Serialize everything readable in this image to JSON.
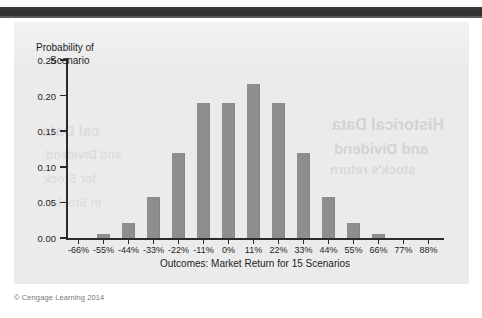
{
  "page": {
    "top_strip_text": "Part 2   Valuation",
    "credit": "© Cengage Learning 2014",
    "ghost_text": {
      "g1": "Historical Data",
      "g2": "and Dividend",
      "g3": "stock's return",
      "g4": "cal Data",
      "g5": "and Dividend",
      "g6": "for Stock",
      "g7": "in Stocks"
    }
  },
  "colors": {
    "bar": "#8e8e8e",
    "axis": "#2b2b2b",
    "panel_background": "#ebebeb",
    "header_bar": "#303032",
    "text": "#1d1d1d",
    "credit_text": "#77777a"
  },
  "chart_data": {
    "type": "bar",
    "title": "",
    "xlabel": "Outcomes: Market Return for 15 Scenarios",
    "ylabel": "Probability of Scenario",
    "ylabel_line1": "Probability of",
    "ylabel_line2": "Scenario",
    "categories": [
      "-66%",
      "-55%",
      "-44%",
      "-33%",
      "-22%",
      "-11%",
      "0%",
      "11%",
      "22%",
      "33%",
      "44%",
      "55%",
      "66%",
      "77%",
      "88%"
    ],
    "values": [
      0.0,
      0.005,
      0.021,
      0.058,
      0.12,
      0.189,
      0.189,
      0.216,
      0.189,
      0.12,
      0.058,
      0.021,
      0.005,
      0.0,
      0.0
    ],
    "ylim": [
      0.0,
      0.25
    ],
    "yticks": [
      "0.00",
      "0.05",
      "0.10",
      "0.15",
      "0.20",
      "0.25"
    ],
    "ytick_values": [
      0.0,
      0.05,
      0.1,
      0.15,
      0.2,
      0.25
    ],
    "grid": false,
    "legend": false
  }
}
